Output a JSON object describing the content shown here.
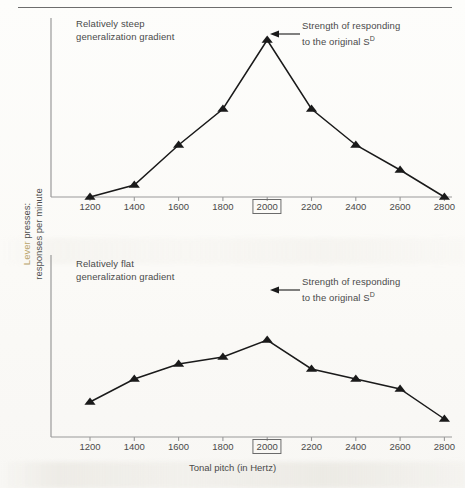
{
  "figure": {
    "y_axis_label": "Lever presses:\nresponses per minute",
    "y_axis_label_highlight": "Lever",
    "x_axis_title": "Tonal pitch (in Hertz)",
    "annotation_line1": "Strength of responding",
    "annotation_line2_pre": "to the original S",
    "annotation_line2_sup": "D",
    "marker_shape": "triangle-up",
    "line_color": "#1a1a1a",
    "axis_color": "#9a9a9a",
    "text_color": "#4a4a4a",
    "highlighted_tick": "2000"
  },
  "chart_data": [
    {
      "type": "line",
      "id": "steep",
      "title": "Relatively steep\ngeneralization gradient",
      "xlabel": "Tonal pitch (in Hertz)",
      "ylabel": "Lever presses: responses per minute",
      "categories": [
        1200,
        1400,
        1600,
        1800,
        2000,
        2200,
        2400,
        2600,
        2800
      ],
      "tick_labels": [
        "1200",
        "1400",
        "1600",
        "1800",
        "2000",
        "2200",
        "2400",
        "2600",
        "2800"
      ],
      "values": [
        0,
        12,
        52,
        88,
        157,
        88,
        52,
        27,
        0
      ],
      "ylim": [
        0,
        180
      ],
      "grid": false,
      "legend": "none",
      "annotation": "Strength of responding to the original S^D",
      "annotation_target": 2000
    },
    {
      "type": "line",
      "id": "flat",
      "title": "Relatively flat\ngeneralization gradient",
      "xlabel": "Tonal pitch (in Hertz)",
      "ylabel": "Lever presses: responses per minute",
      "categories": [
        1200,
        1400,
        1600,
        1800,
        2000,
        2200,
        2400,
        2600,
        2800
      ],
      "tick_labels": [
        "1200",
        "1400",
        "1600",
        "1800",
        "2000",
        "2200",
        "2400",
        "2600",
        "2800"
      ],
      "values": [
        35,
        58,
        73,
        80,
        97,
        68,
        58,
        48,
        18
      ],
      "ylim": [
        0,
        180
      ],
      "grid": false,
      "legend": "none",
      "annotation": "Strength of responding to the original S^D",
      "annotation_target": 2000
    }
  ]
}
